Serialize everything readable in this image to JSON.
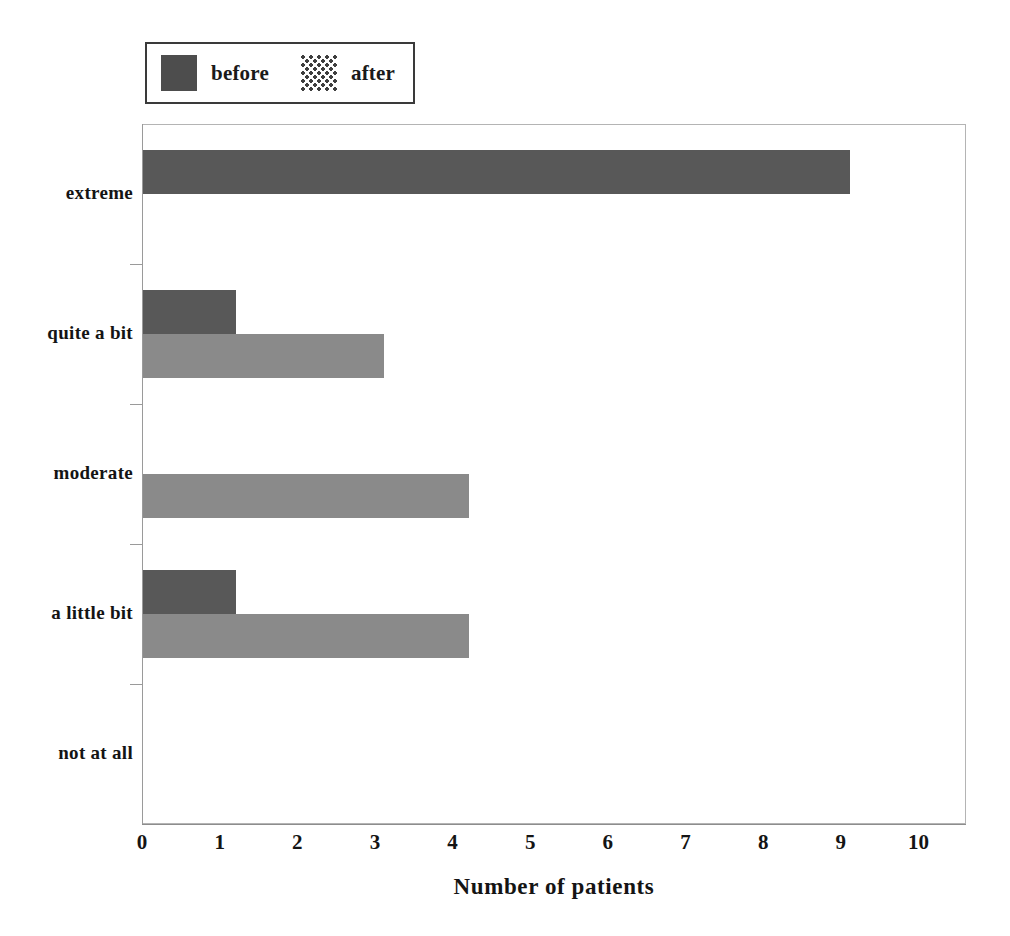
{
  "chart_data": {
    "type": "bar",
    "orientation": "horizontal",
    "title": "",
    "xlabel": "Number of patients",
    "ylabel": "",
    "categories": [
      "not at all",
      "a little bit",
      "moderate",
      "quite a bit",
      "extreme"
    ],
    "series": [
      {
        "name": "before",
        "color": "#585858",
        "values": [
          0,
          1.2,
          0,
          1.2,
          9.1
        ]
      },
      {
        "name": "after",
        "color": "#8a8a8a",
        "values": [
          0,
          4.2,
          4.2,
          3.1,
          0
        ]
      }
    ],
    "xlim": [
      0,
      10.6
    ],
    "xticks": [
      0,
      1,
      2,
      3,
      4,
      5,
      6,
      7,
      8,
      9,
      10
    ],
    "xtick_labels": [
      "0",
      "1",
      "2",
      "3",
      "4",
      "5",
      "6",
      "7",
      "8",
      "9",
      "10"
    ],
    "grid": false,
    "legend_position": "above-left",
    "legend": [
      {
        "label": "before",
        "swatch": "solid-dark"
      },
      {
        "label": "after",
        "swatch": "dotted-pattern"
      }
    ]
  },
  "legend": {
    "entries": [
      {
        "label": "before"
      },
      {
        "label": "after"
      }
    ]
  },
  "axes": {
    "x_title": "Number of patients",
    "x_tick_labels": [
      "0",
      "1",
      "2",
      "3",
      "4",
      "5",
      "6",
      "7",
      "8",
      "9",
      "10"
    ],
    "y_tick_labels": [
      "extreme",
      "quite a bit",
      "moderate",
      "a little bit",
      "not at all"
    ]
  },
  "colors": {
    "before": "#585858",
    "after": "#8a8a8a",
    "frame": "#9a9a9a",
    "text": "#141414",
    "background": "#ffffff"
  }
}
